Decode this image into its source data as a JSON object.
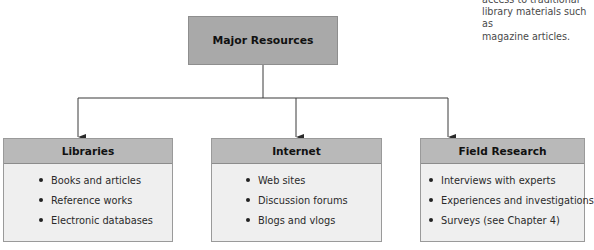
{
  "margin_note": {
    "text": "access to traditional\nlibrary materials such as\nmagazine articles."
  },
  "root": {
    "label": "Major Resources"
  },
  "categories": [
    {
      "title": "Libraries",
      "items": [
        "Books and articles",
        "Reference works",
        "Electronic databases"
      ]
    },
    {
      "title": "Internet",
      "items": [
        "Web sites",
        "Discussion forums",
        "Blogs and vlogs"
      ]
    },
    {
      "title": "Field Research",
      "items": [
        "Interviews with experts",
        "Experiences and investigations",
        "Surveys (see Chapter 4)"
      ]
    }
  ],
  "colors": {
    "root_fill": "#a9a9a9",
    "header_fill": "#b9b9b9",
    "body_fill": "#efefef",
    "line": "#3a3a3a"
  }
}
